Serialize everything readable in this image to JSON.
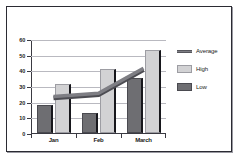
{
  "chart_data": {
    "type": "bar",
    "title": "",
    "subtitle": "",
    "xlabel": "",
    "ylabel": "",
    "categories": [
      "Jan",
      "Feb",
      "March"
    ],
    "series": [
      {
        "name": "Low",
        "type": "bar",
        "values": [
          18,
          13,
          35
        ],
        "color": "#6e6e72"
      },
      {
        "name": "High",
        "type": "bar",
        "values": [
          31,
          41,
          53
        ],
        "color": "#d2d2d4"
      },
      {
        "name": "Average",
        "type": "line",
        "values": [
          24,
          26,
          42
        ],
        "color": "#7e7e84"
      }
    ],
    "ylim": [
      0,
      60
    ],
    "y_ticks": [
      0,
      10,
      20,
      30,
      40,
      50,
      60
    ],
    "y_tick_labels": [
      "0",
      "10",
      "20",
      "30",
      "40",
      "50",
      "60"
    ],
    "grid": true,
    "legend_position": "right",
    "legend": [
      {
        "label": "Average",
        "marker": "line",
        "color": "#7e7e84"
      },
      {
        "label": "High",
        "marker": "square",
        "color": "#d2d2d4"
      },
      {
        "label": "Low",
        "marker": "square",
        "color": "#6e6e72"
      }
    ]
  },
  "colors": {
    "frame_border": "#2b2b33",
    "gridline": "#b9b9c0",
    "axis": "#3a3a42",
    "background": "#ffffff",
    "low_bar": "#6e6e72",
    "high_bar": "#d2d2d4",
    "average_line": "#7e7e84"
  }
}
